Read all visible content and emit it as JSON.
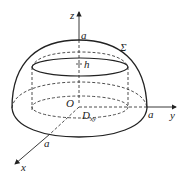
{
  "diagram": {
    "type": "hemisphere-cap-with-axes",
    "labels": {
      "z_axis": "z",
      "y_axis": "y",
      "x_axis": "x",
      "origin": "O",
      "top_radius": "a",
      "y_radius": "a",
      "x_radius": "a",
      "surface": "Σ",
      "height": "h",
      "region": "D",
      "region_sub": "xy"
    },
    "colors": {
      "stroke": "#222222",
      "background": "#ffffff"
    }
  }
}
